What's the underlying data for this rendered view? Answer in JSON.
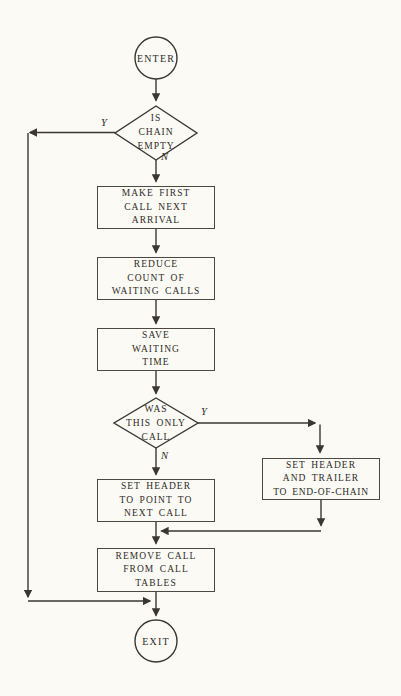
{
  "colors": {
    "background": "#fbfaf5",
    "ink": "#2e2b27",
    "line": "#3a3733",
    "box_border": "#4b4843"
  },
  "flowchart": {
    "nodes": {
      "enter": {
        "label": "ENTER"
      },
      "decision_chain_empty": {
        "lines": [
          "IS",
          "CHAIN",
          "EMPTY"
        ]
      },
      "make_first_call": {
        "lines": [
          "MAKE FIRST",
          "CALL NEXT",
          "ARRIVAL"
        ]
      },
      "reduce_count": {
        "lines": [
          "REDUCE",
          "COUNT OF",
          "WAITING CALLS"
        ]
      },
      "save_waiting_time": {
        "lines": [
          "SAVE",
          "WAITING",
          "TIME"
        ]
      },
      "decision_only_call": {
        "lines": [
          "WAS",
          "THIS ONLY",
          "CALL"
        ]
      },
      "set_header_point": {
        "lines": [
          "SET HEADER",
          "TO POINT TO",
          "NEXT CALL"
        ]
      },
      "set_header_trailer": {
        "lines": [
          "SET HEADER",
          "AND TRAILER",
          "TO END-OF-CHAIN"
        ]
      },
      "remove_call": {
        "lines": [
          "REMOVE CALL",
          "FROM CALL",
          "TABLES"
        ]
      },
      "exit": {
        "label": "EXIT"
      }
    },
    "edge_labels": {
      "chain_empty_yes": "Y",
      "chain_empty_no": "N",
      "only_call_yes": "Y",
      "only_call_no": "N"
    }
  }
}
